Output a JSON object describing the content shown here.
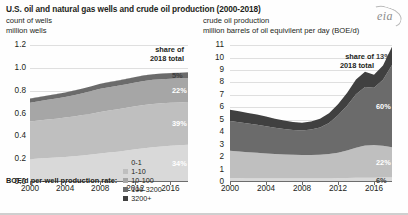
{
  "header": {
    "title": "U.S. oil and natural gas wells and crude oil production (2000-2018)",
    "left_sub_1": "count of wells",
    "left_sub_2": "million wells",
    "right_sub_1": "crude oil production",
    "right_sub_2": "million barrels of oil equivilent per day (BOE/d)",
    "logo_text": "eia"
  },
  "legend": {
    "title": "BOE/d per-well production rate:",
    "items": [
      {
        "label": "0-1",
        "color": "#d9d9d9"
      },
      {
        "label": "1-10",
        "color": "#bfbfbf"
      },
      {
        "label": "10-100",
        "color": "#a6a6a6"
      },
      {
        "label": "100-3200",
        "color": "#6b6b6b"
      },
      {
        "label": "3200+",
        "color": "#404040"
      }
    ]
  },
  "share_header": "share of\n2018 total",
  "share_header_line1": "share of",
  "share_header_line2": "2018 total",
  "chart_data": [
    {
      "type": "area",
      "id": "wells",
      "title": "count of wells",
      "ylabel": "million wells",
      "xlabel": "",
      "ylim": [
        0,
        1.2
      ],
      "xlim": [
        2000,
        2018
      ],
      "grid": true,
      "legend_position": "bottom",
      "ytick_labels": [
        "0.0",
        "0.2",
        "0.4",
        "0.6",
        "0.8",
        "1.0",
        "1.2"
      ],
      "ytick_values": [
        0,
        0.2,
        0.4,
        0.6,
        0.8,
        1.0,
        1.2
      ],
      "xtick_labels": [
        "2000",
        "2004",
        "2008",
        "2012",
        "2016"
      ],
      "xtick_values": [
        2000,
        2004,
        2008,
        2012,
        2016
      ],
      "x": [
        2000,
        2001,
        2002,
        2003,
        2004,
        2005,
        2006,
        2007,
        2008,
        2009,
        2010,
        2011,
        2012,
        2013,
        2014,
        2015,
        2016,
        2017,
        2018
      ],
      "series": [
        {
          "name": "0-1",
          "color": "#d9d9d9",
          "values": [
            0.2,
            0.205,
            0.21,
            0.214,
            0.219,
            0.225,
            0.232,
            0.24,
            0.25,
            0.258,
            0.266,
            0.276,
            0.286,
            0.296,
            0.305,
            0.312,
            0.318,
            0.322,
            0.326
          ]
        },
        {
          "name": "1-10",
          "color": "#bfbfbf",
          "values": [
            0.33,
            0.334,
            0.338,
            0.341,
            0.345,
            0.349,
            0.354,
            0.358,
            0.364,
            0.368,
            0.371,
            0.374,
            0.377,
            0.379,
            0.379,
            0.378,
            0.376,
            0.375,
            0.374
          ]
        },
        {
          "name": "10-100",
          "color": "#a6a6a6",
          "values": [
            0.165,
            0.168,
            0.172,
            0.176,
            0.18,
            0.186,
            0.192,
            0.198,
            0.203,
            0.204,
            0.205,
            0.207,
            0.209,
            0.21,
            0.211,
            0.211,
            0.211,
            0.211,
            0.211
          ]
        },
        {
          "name": "100-3200",
          "color": "#6b6b6b",
          "values": [
            0.035,
            0.036,
            0.037,
            0.038,
            0.039,
            0.04,
            0.041,
            0.042,
            0.043,
            0.044,
            0.045,
            0.046,
            0.047,
            0.048,
            0.048,
            0.048,
            0.048,
            0.048,
            0.048
          ]
        },
        {
          "name": "3200+",
          "color": "#404040",
          "values": [
            0.0008,
            0.0008,
            0.0008,
            0.0008,
            0.0009,
            0.0009,
            0.0009,
            0.001,
            0.001,
            0.001,
            0.0011,
            0.0012,
            0.0013,
            0.0014,
            0.0015,
            0.0015,
            0.0015,
            0.0016,
            0.0016
          ]
        }
      ],
      "share_labels": [
        {
          "text": "5%",
          "band": "100-3200",
          "value": 5
        },
        {
          "text": "22%",
          "band": "10-100",
          "value": 22
        },
        {
          "text": "39%",
          "band": "1-10",
          "value": 39
        },
        {
          "text": "34%",
          "band": "0-1",
          "value": 34
        }
      ]
    },
    {
      "type": "area",
      "id": "production",
      "title": "crude oil production",
      "ylabel": "million barrels of oil equivilent per day (BOE/d)",
      "xlabel": "",
      "ylim": [
        0,
        11
      ],
      "xlim": [
        2000,
        2018
      ],
      "grid": true,
      "legend_position": "bottom",
      "ytick_labels": [
        "0",
        "1",
        "2",
        "3",
        "4",
        "5",
        "6",
        "7",
        "8",
        "9",
        "10",
        "11"
      ],
      "ytick_values": [
        0,
        1,
        2,
        3,
        4,
        5,
        6,
        7,
        8,
        9,
        10,
        11
      ],
      "xtick_labels": [
        "2000",
        "2004",
        "2008",
        "2012",
        "2016"
      ],
      "xtick_values": [
        2000,
        2004,
        2008,
        2012,
        2016
      ],
      "x": [
        2000,
        2001,
        2002,
        2003,
        2004,
        2005,
        2006,
        2007,
        2008,
        2009,
        2010,
        2011,
        2012,
        2013,
        2014,
        2015,
        2016,
        2017,
        2018
      ],
      "series": [
        {
          "name": "0-1",
          "color": "#d9d9d9",
          "values": [
            0.3,
            0.3,
            0.29,
            0.29,
            0.28,
            0.28,
            0.28,
            0.28,
            0.28,
            0.28,
            0.28,
            0.29,
            0.3,
            0.32,
            0.34,
            0.35,
            0.35,
            0.36,
            0.36
          ]
        },
        {
          "name": "1-10",
          "color": "#bfbfbf",
          "values": [
            2.2,
            2.15,
            2.1,
            2.05,
            2.0,
            1.96,
            1.93,
            1.9,
            1.88,
            1.88,
            1.9,
            1.95,
            2.05,
            2.2,
            2.4,
            2.58,
            2.62,
            2.55,
            2.44
          ]
        },
        {
          "name": "10-100",
          "color": "#6b6b6b",
          "values": [
            2.4,
            2.35,
            2.3,
            2.25,
            2.2,
            2.12,
            2.05,
            2.0,
            1.98,
            2.05,
            2.2,
            2.5,
            3.0,
            3.6,
            4.3,
            4.7,
            4.6,
            5.3,
            6.6
          ]
        },
        {
          "name": "100-3200",
          "color": "#404040",
          "values": [
            0.9,
            0.88,
            0.86,
            0.82,
            0.78,
            0.72,
            0.68,
            0.64,
            0.62,
            0.64,
            0.7,
            0.78,
            0.9,
            1.02,
            1.18,
            1.22,
            1.05,
            1.15,
            1.45
          ]
        }
      ],
      "share_labels": [
        {
          "text": "13%",
          "band": "100-3200",
          "value": 13
        },
        {
          "text": "60%",
          "band": "10-100",
          "value": 60
        },
        {
          "text": "22%",
          "band": "1-10",
          "value": 22
        },
        {
          "text": "6%",
          "band": "0-1",
          "value": 6
        }
      ]
    }
  ]
}
